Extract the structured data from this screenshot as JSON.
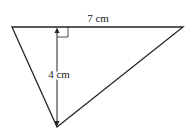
{
  "diagram": {
    "type": "triangle",
    "base_label": "7 cm",
    "height_label": "4 cm",
    "stroke_color": "#222222",
    "right_angle_marker": true
  }
}
